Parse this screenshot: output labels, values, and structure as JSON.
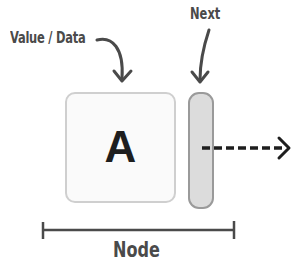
{
  "diagram": {
    "type": "linked-list-node",
    "labels": {
      "value": "Value / Data",
      "next": "Next",
      "node": "Node"
    },
    "node": {
      "value": "A"
    },
    "colors": {
      "text": "#4a4a4a",
      "value_box_border": "#cfcfcf",
      "value_box_fill": "#fafafa",
      "next_box_border": "#9a9a9a",
      "next_box_fill": "#dcdcdc",
      "arrow": "#1e1e1e",
      "bracket": "#4a4a4a"
    }
  }
}
